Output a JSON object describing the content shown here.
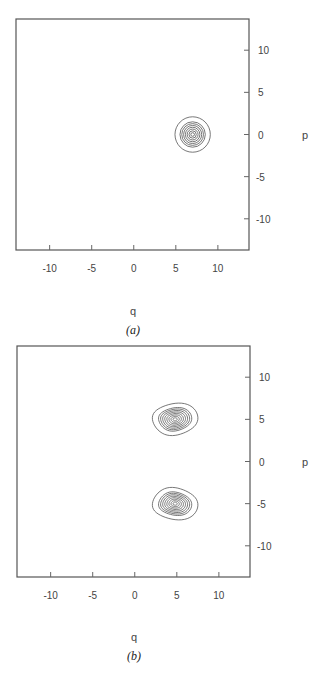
{
  "chart_data": [
    {
      "type": "contour",
      "panel": "a",
      "caption": "(a)",
      "xlabel": "q",
      "ylabel": "p",
      "xlim": [
        -14,
        13.7
      ],
      "ylim": [
        -13.7,
        13.7
      ],
      "xticks": [
        -10,
        -5,
        0,
        5,
        10
      ],
      "xtick_labels": [
        "-10",
        "-5",
        "0",
        "5",
        "10"
      ],
      "yticks": [
        10,
        5,
        0,
        -5,
        -10
      ],
      "ytick_labels": [
        "10",
        "5",
        "0",
        "-5",
        "-10"
      ],
      "ytick_side": "right",
      "grid": false,
      "peaks": [
        {
          "q": 7,
          "p": 0,
          "rx": 2.1,
          "ry": 2.1,
          "levels": 8,
          "shape": "circle"
        }
      ]
    },
    {
      "type": "contour",
      "panel": "b",
      "caption": "(b)",
      "xlabel": "q",
      "ylabel": "p",
      "xlim": [
        -14,
        13.7
      ],
      "ylim": [
        -13.7,
        13.7
      ],
      "xticks": [
        -10,
        -5,
        0,
        5,
        10
      ],
      "xtick_labels": [
        "-10",
        "-5",
        "0",
        "5",
        "10"
      ],
      "yticks": [
        10,
        5,
        0,
        -5,
        -10
      ],
      "ytick_labels": [
        "10",
        "5",
        "0",
        "-5",
        "-10"
      ],
      "ytick_side": "right",
      "grid": false,
      "peaks": [
        {
          "q": 4.8,
          "p": 5,
          "rx": 2.7,
          "ry": 1.9,
          "levels": 9,
          "shape": "egg",
          "tilt": 1
        },
        {
          "q": 4.8,
          "p": -5,
          "rx": 2.7,
          "ry": 1.9,
          "levels": 9,
          "shape": "egg",
          "tilt": -1
        }
      ]
    }
  ]
}
